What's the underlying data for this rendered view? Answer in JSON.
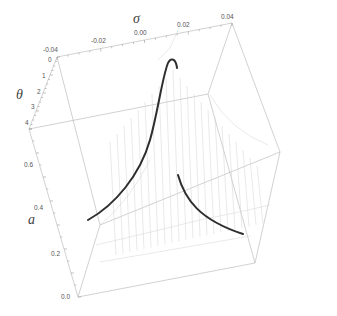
{
  "chart_data": {
    "type": "3d-surface",
    "title": "",
    "axes": {
      "sigma": {
        "label": "σ",
        "ticks": [
          "-0.04",
          "-0.02",
          "0.00",
          "0.02",
          "0.04"
        ],
        "range": [
          -0.04,
          0.04
        ]
      },
      "theta": {
        "label": "θ",
        "ticks": [
          "0",
          "1",
          "2",
          "3",
          "4"
        ],
        "range": [
          0,
          4
        ]
      },
      "a": {
        "label": "a",
        "ticks": [
          "0.0",
          "0.2",
          "0.4",
          "0.6"
        ],
        "range": [
          0.0,
          0.7
        ]
      }
    },
    "series": [
      {
        "name": "highlighted curve (left branch)",
        "style": "thick black",
        "description": "rises from low a at sigma<0 to a peak near sigma≈0"
      },
      {
        "name": "highlighted curve (right branch)",
        "style": "thick black",
        "description": "decays from sigma≈0 toward larger sigma"
      },
      {
        "name": "surface mesh",
        "style": "thin gray hatched lines"
      }
    ],
    "grid": false,
    "legend": null,
    "box": true
  },
  "colors": {
    "box": "#b8b8b8",
    "mesh": "#cfcfcf",
    "curve": "#333333",
    "tick_text": "#555555"
  }
}
